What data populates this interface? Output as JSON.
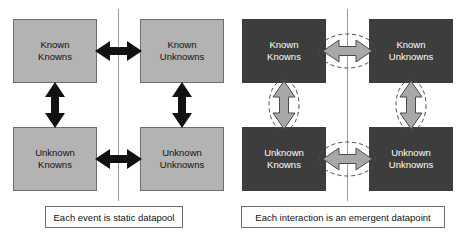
{
  "diagram": {
    "title_semantic": "known-unknowns-matrix-comparison",
    "colors": {
      "static_box_fill": "#b3b3b3",
      "static_box_border": "#6e6e6e",
      "static_box_text": "#111111",
      "emergent_box_fill": "#3d3d3d",
      "emergent_box_text": "#ffffff",
      "static_arrow": "#111111",
      "emergent_arrow_fill": "#a8a8a8",
      "emergent_arrow_stroke": "#4a4a4a",
      "emergent_ellipse_stroke": "#4a4a4a",
      "divider_line": "#9a9a9a",
      "background": "#ffffff"
    },
    "panels": [
      {
        "id": "static-datapool-panel",
        "style": "light",
        "caption": "Each event is static datapool",
        "quadrants": [
          {
            "id": "known-knowns",
            "line1": "Known",
            "line2": "Knowns"
          },
          {
            "id": "known-unknowns",
            "line1": "Known",
            "line2": "Unknowns"
          },
          {
            "id": "unknown-knowns",
            "line1": "Unknown",
            "line2": "Knowns"
          },
          {
            "id": "unknown-unknowns",
            "line1": "Unknown",
            "line2": "Unknowns"
          }
        ],
        "connectors": [
          {
            "id": "top-horizontal",
            "orientation": "horizontal",
            "style": "solid-black",
            "highlighted": false
          },
          {
            "id": "bottom-horizontal",
            "orientation": "horizontal",
            "style": "solid-black",
            "highlighted": false
          },
          {
            "id": "left-vertical",
            "orientation": "vertical",
            "style": "solid-black",
            "highlighted": false
          },
          {
            "id": "right-vertical",
            "orientation": "vertical",
            "style": "solid-black",
            "highlighted": false
          }
        ]
      },
      {
        "id": "emergent-datapoint-panel",
        "style": "dark",
        "caption": "Each interaction is an emergent datapoint",
        "quadrants": [
          {
            "id": "known-knowns",
            "line1": "Known",
            "line2": "Knowns"
          },
          {
            "id": "known-unknowns",
            "line1": "Known",
            "line2": "Unknowns"
          },
          {
            "id": "unknown-knowns",
            "line1": "Unknown",
            "line2": "Knowns"
          },
          {
            "id": "unknown-unknowns",
            "line1": "Unknown",
            "line2": "Unknowns"
          }
        ],
        "connectors": [
          {
            "id": "top-horizontal",
            "orientation": "horizontal",
            "style": "gray-outlined",
            "highlighted": true
          },
          {
            "id": "bottom-horizontal",
            "orientation": "horizontal",
            "style": "gray-outlined",
            "highlighted": true
          },
          {
            "id": "left-vertical",
            "orientation": "vertical",
            "style": "gray-outlined",
            "highlighted": true
          },
          {
            "id": "right-vertical",
            "orientation": "vertical",
            "style": "gray-outlined",
            "highlighted": true
          }
        ]
      }
    ]
  }
}
